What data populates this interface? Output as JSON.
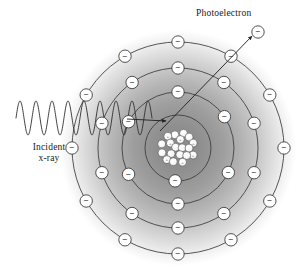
{
  "figure": {
    "labels": {
      "photoelectron": "Photoelectron",
      "incident_line1": "Incident",
      "incident_line2": "x-ray"
    },
    "colors": {
      "stroke": "#3a3a3a",
      "glow_center": "#8c8c8c",
      "glow_edge": "#ffffff",
      "electron_fill": "#ffffff",
      "nucleus_fill": "#f2f2f2",
      "background": "#ffffff",
      "text": "#1a1a1a"
    }
  },
  "atom": {
    "center": {
      "x": 178,
      "y": 148
    },
    "glow_radius": 118,
    "shells": [
      {
        "name": "shell-k",
        "radius": 33,
        "electron_angles": [
          95
        ]
      },
      {
        "name": "shell-l",
        "radius": 56,
        "electron_angles": [
          -90,
          -34,
          26,
          90,
          152,
          208
        ]
      },
      {
        "name": "shell-m",
        "radius": 80,
        "electron_angles": [
          -90,
          -55,
          -18,
          18,
          55,
          90,
          125,
          162,
          198,
          235
        ]
      },
      {
        "name": "shell-n",
        "radius": 106,
        "electron_angles": [
          -90,
          -60,
          -30,
          0,
          30,
          60,
          90,
          120,
          150,
          180,
          210,
          240
        ]
      }
    ],
    "electron_symbol": "−",
    "electron_radius": 6.2,
    "nucleus": {
      "radius": 20,
      "particle_count": 26,
      "particle_radius": 4.0,
      "proton_symbol": "+"
    }
  },
  "xray": {
    "start_x": 16,
    "end_x": 152,
    "baseline_y": 118,
    "amplitude": 17,
    "cycles": 8.5
  },
  "arrows": {
    "absorption": {
      "x1": 127,
      "y1": 119,
      "x2": 166,
      "y2": 121
    },
    "photoelectron": {
      "x1": 160,
      "y1": 131,
      "x2": 252,
      "y2": 36
    }
  },
  "photoelectron_particle": {
    "x": 258,
    "y": 32
  }
}
